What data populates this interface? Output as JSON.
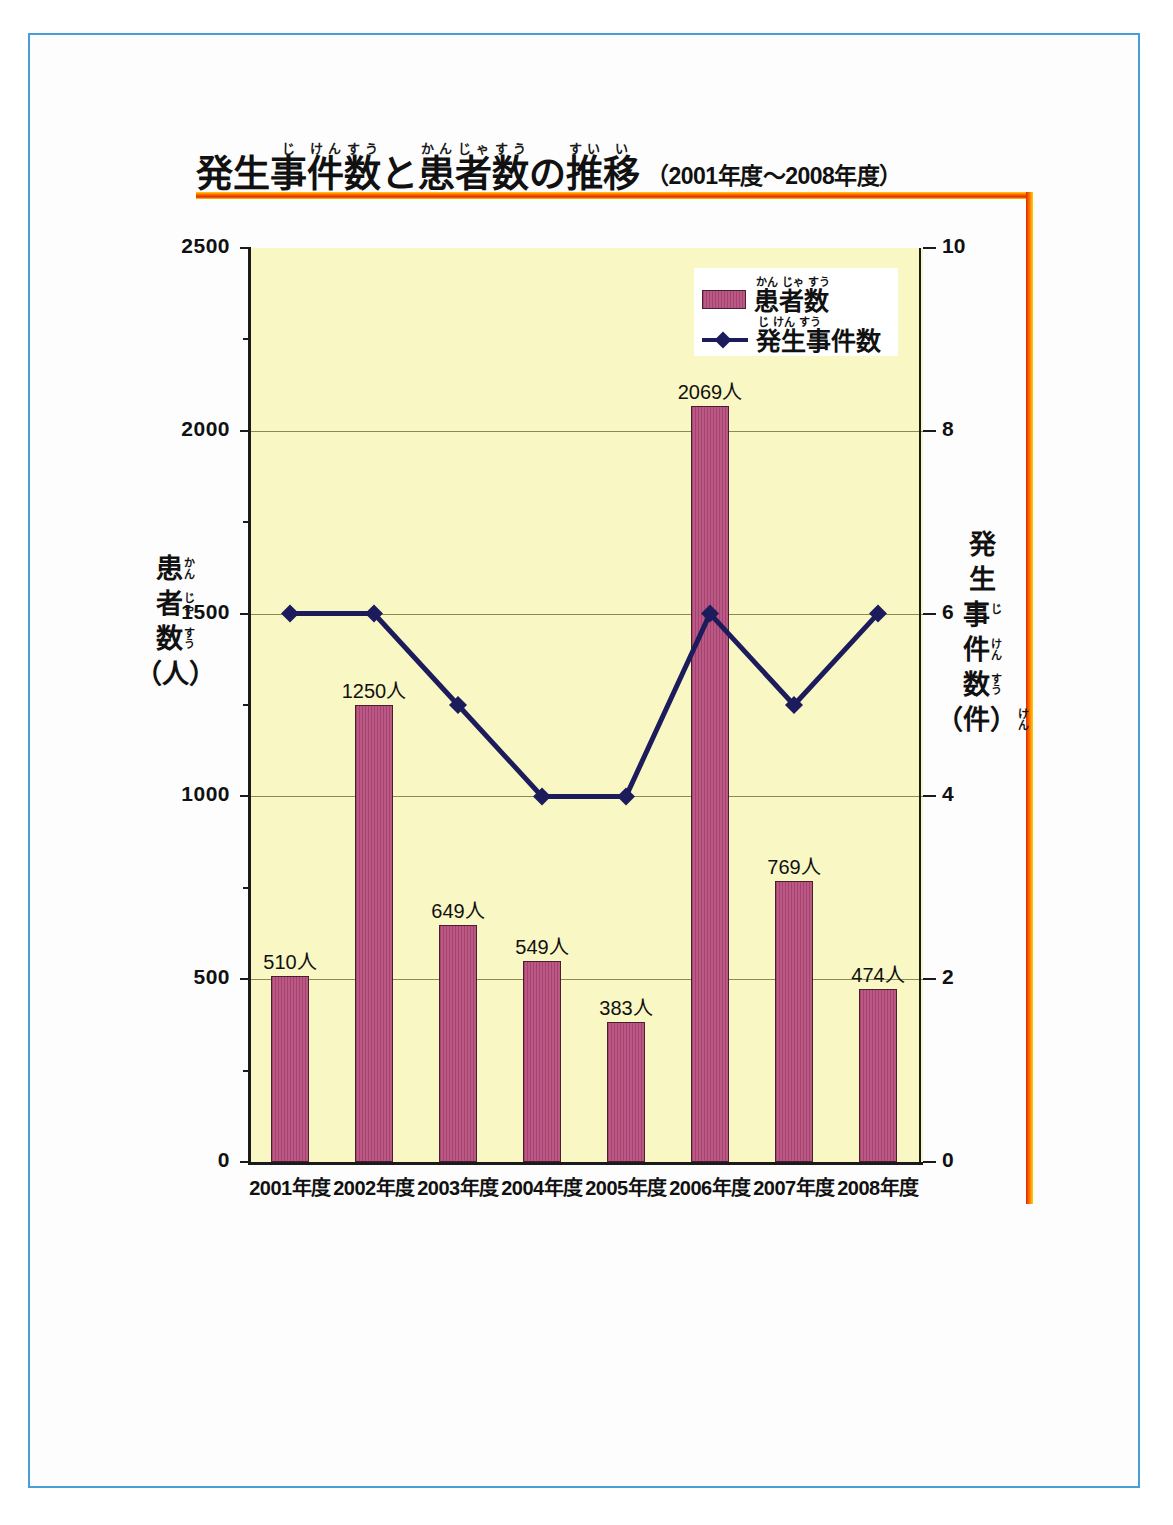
{
  "page": {
    "border_color": "#4a9ed8",
    "background": "#ffffff"
  },
  "title": {
    "ruby_groups": [
      {
        "base": "発",
        "ruby": ""
      },
      {
        "base": "生",
        "ruby": ""
      },
      {
        "base": "事",
        "ruby": "じ"
      },
      {
        "base": "件",
        "ruby": "けん"
      },
      {
        "base": "数",
        "ruby": "すう"
      },
      {
        "base": "と",
        "ruby": ""
      },
      {
        "base": "患",
        "ruby": "かん"
      },
      {
        "base": "者",
        "ruby": "じゃ"
      },
      {
        "base": "数",
        "ruby": "すう"
      },
      {
        "base": "の",
        "ruby": ""
      },
      {
        "base": "推",
        "ruby": "すい"
      },
      {
        "base": "移",
        "ruby": "い"
      }
    ],
    "main": "発生事件数と患者数の推移",
    "range": "（2001年度〜2008年度）",
    "accent_color": "#ff6a00"
  },
  "legend": {
    "items": [
      {
        "label": "患者数",
        "ruby": [
          "かん",
          "じゃ",
          "すう"
        ],
        "marker": "bar-swatch",
        "color": "#a8416e"
      },
      {
        "label": "発生事件数",
        "ruby": [
          "じ",
          "けん",
          "すう"
        ],
        "marker": "line-diamond",
        "color": "#1c1c5c"
      }
    ]
  },
  "axes": {
    "left": {
      "title_chars": [
        {
          "base": "患",
          "ruby": "かん"
        },
        {
          "base": "者",
          "ruby": "じゃ"
        },
        {
          "base": "数",
          "ruby": "すう"
        },
        {
          "base": "（人）",
          "ruby": ""
        }
      ],
      "title_text": "患者数（人）",
      "ticks": [
        "0",
        "500",
        "1000",
        "1500",
        "2000",
        "2500"
      ],
      "min": 0,
      "max": 2500,
      "minor_ticks": [
        250,
        750,
        1250,
        1750,
        2250
      ]
    },
    "right": {
      "title_chars": [
        {
          "base": "発",
          "ruby": ""
        },
        {
          "base": "生",
          "ruby": ""
        },
        {
          "base": "事",
          "ruby": "じ"
        },
        {
          "base": "件",
          "ruby": "けん"
        },
        {
          "base": "数",
          "ruby": "すう"
        },
        {
          "base": "（件）",
          "ruby": "けん"
        }
      ],
      "title_text": "発生事件数（件）",
      "ticks": [
        "0",
        "2",
        "4",
        "6",
        "8",
        "10"
      ],
      "min": 0,
      "max": 10
    }
  },
  "plot": {
    "background": "#f9f7c4",
    "gridline_color": "#8a8a52",
    "axis_color": "#1b1b1b"
  },
  "chart_data": {
    "type": "bar",
    "xlabel": "",
    "ylabel": "患者数（人）",
    "y2label": "発生事件数（件）",
    "ylim": [
      0,
      2500
    ],
    "y2lim": [
      0,
      10
    ],
    "grid": true,
    "legend_position": "top-right",
    "categories": [
      "2001年度",
      "2002年度",
      "2003年度",
      "2004年度",
      "2005年度",
      "2006年度",
      "2007年度",
      "2008年度"
    ],
    "series": [
      {
        "name": "患者数",
        "type": "bar",
        "axis": "left",
        "unit": "人",
        "color": "#a8416e",
        "values": [
          510,
          1250,
          649,
          549,
          383,
          2069,
          769,
          474
        ],
        "data_labels": [
          "510人",
          "1250人",
          "649人",
          "549人",
          "383人",
          "2069人",
          "769人",
          "474人"
        ]
      },
      {
        "name": "発生事件数",
        "type": "line",
        "axis": "right",
        "unit": "件",
        "color": "#1c1c5c",
        "marker": "diamond",
        "values": [
          6,
          6,
          5,
          4,
          4,
          6,
          5,
          6
        ]
      }
    ]
  }
}
